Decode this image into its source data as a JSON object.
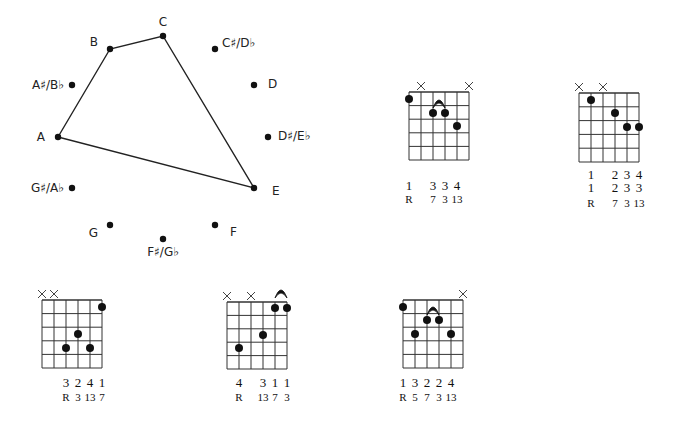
{
  "circle": {
    "notes": [
      {
        "name": "C",
        "x": 163,
        "y": 36,
        "lx": 163,
        "ly": 26,
        "anchor": "middle"
      },
      {
        "name": "C♯/D♭",
        "x": 215,
        "y": 49,
        "lx": 222,
        "ly": 47,
        "anchor": "start"
      },
      {
        "name": "D",
        "x": 254,
        "y": 85,
        "lx": 268,
        "ly": 88,
        "anchor": "start"
      },
      {
        "name": "D♯/E♭",
        "x": 268,
        "y": 137,
        "lx": 278,
        "ly": 140,
        "anchor": "start"
      },
      {
        "name": "E",
        "x": 254,
        "y": 188,
        "lx": 272,
        "ly": 195,
        "anchor": "start"
      },
      {
        "name": "F",
        "x": 215,
        "y": 225,
        "lx": 230,
        "ly": 236,
        "anchor": "start"
      },
      {
        "name": "F♯/G♭",
        "x": 163,
        "y": 239,
        "lx": 163,
        "ly": 256,
        "anchor": "middle"
      },
      {
        "name": "G",
        "x": 110,
        "y": 225,
        "lx": 98,
        "ly": 237,
        "anchor": "end"
      },
      {
        "name": "G♯/A♭",
        "x": 72,
        "y": 188,
        "lx": 64,
        "ly": 192,
        "anchor": "end"
      },
      {
        "name": "A",
        "x": 58,
        "y": 137,
        "lx": 45,
        "ly": 141,
        "anchor": "end"
      },
      {
        "name": "A♯/B♭",
        "x": 72,
        "y": 85,
        "lx": 64,
        "ly": 89,
        "anchor": "end"
      },
      {
        "name": "B",
        "x": 110,
        "y": 49,
        "lx": 98,
        "ly": 46,
        "anchor": "end"
      }
    ],
    "polygon": [
      "A",
      "B",
      "C",
      "E"
    ]
  },
  "chords": [
    {
      "id": "chord-1",
      "left": 409,
      "top": 92,
      "width": 60,
      "height": 68,
      "muted": [
        1,
        5
      ],
      "dots": [
        {
          "s": 0,
          "y": 99
        },
        {
          "s": 2,
          "y": 113
        },
        {
          "s": 3,
          "y": 113
        },
        {
          "s": 4,
          "y": 126
        }
      ],
      "arch": {
        "from": 2,
        "to": 3,
        "y": 106
      },
      "rows": [
        {
          "cls": "finger",
          "y": 190,
          "vals": [
            "1",
            "",
            "3",
            "3",
            "4",
            ""
          ]
        },
        {
          "cls": "interval",
          "y": 191,
          "offset": 12,
          "vals": [
            "R",
            "",
            "7",
            "3",
            "13",
            ""
          ]
        }
      ]
    },
    {
      "id": "chord-2",
      "left": 579,
      "top": 93,
      "width": 60,
      "height": 69,
      "muted": [
        0,
        2
      ],
      "dots": [
        {
          "s": 1,
          "y": 100
        },
        {
          "s": 3,
          "y": 113
        },
        {
          "s": 4,
          "y": 127
        },
        {
          "s": 5,
          "y": 127
        }
      ],
      "arch": null,
      "rows": [
        {
          "cls": "finger",
          "y": 179,
          "vals": [
            "",
            "1",
            "",
            "2",
            "3",
            "4"
          ]
        },
        {
          "cls": "finger",
          "y": 192,
          "vals": [
            "",
            "1",
            "",
            "2",
            "3",
            "3"
          ]
        },
        {
          "cls": "interval",
          "y": 207,
          "vals": [
            "",
            "R",
            "",
            "7",
            "3",
            "13"
          ]
        }
      ]
    },
    {
      "id": "chord-4",
      "left": 42,
      "top": 300,
      "width": 60,
      "height": 68,
      "muted": [
        0,
        1
      ],
      "dots": [
        {
          "s": 5,
          "y": 307
        },
        {
          "s": 3,
          "y": 334
        },
        {
          "s": 2,
          "y": 348
        },
        {
          "s": 4,
          "y": 348
        }
      ],
      "arch": null,
      "rows": [
        {
          "cls": "finger",
          "y": 387,
          "vals": [
            "",
            "",
            "3",
            "2",
            "4",
            "1"
          ]
        },
        {
          "cls": "interval",
          "y": 401,
          "vals": [
            "",
            "",
            "R",
            "3",
            "13",
            "7"
          ]
        }
      ]
    },
    {
      "id": "chord-5",
      "left": 227,
      "top": 302,
      "width": 60,
      "height": 67,
      "muted": [
        0,
        2
      ],
      "dots": [
        {
          "s": 4,
          "y": 308
        },
        {
          "s": 5,
          "y": 308
        },
        {
          "s": 3,
          "y": 335
        },
        {
          "s": 1,
          "y": 348
        }
      ],
      "arch": {
        "from": 4,
        "to": 5,
        "y": 296
      },
      "rows": [
        {
          "cls": "finger",
          "y": 387,
          "vals": [
            "",
            "4",
            "",
            "3",
            "1",
            "1"
          ]
        },
        {
          "cls": "interval",
          "y": 401,
          "vals": [
            "",
            "R",
            "",
            "13",
            "7",
            "3"
          ]
        }
      ]
    },
    {
      "id": "chord-6",
      "left": 403,
      "top": 300,
      "width": 60,
      "height": 68,
      "muted": [
        5
      ],
      "dots": [
        {
          "s": 0,
          "y": 307
        },
        {
          "s": 2,
          "y": 320
        },
        {
          "s": 3,
          "y": 320
        },
        {
          "s": 1,
          "y": 334
        },
        {
          "s": 4,
          "y": 334
        }
      ],
      "arch": {
        "from": 2,
        "to": 3,
        "y": 313
      },
      "rows": [
        {
          "cls": "finger",
          "y": 387,
          "vals": [
            "1",
            "3",
            "2",
            "2",
            "4",
            ""
          ]
        },
        {
          "cls": "interval",
          "y": 401,
          "vals": [
            "R",
            "5",
            "7",
            "3",
            "13",
            ""
          ]
        }
      ]
    }
  ],
  "style": {
    "ink": "#111111",
    "grid": "#333333"
  }
}
